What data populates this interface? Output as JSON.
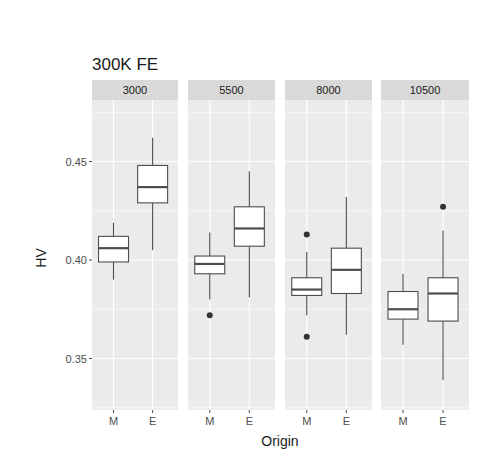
{
  "chart_data": {
    "type": "boxplot",
    "title": "300K FE",
    "xlabel": "Origin",
    "ylabel": "HV",
    "ylim": [
      0.325,
      0.475
    ],
    "yticks": [
      0.35,
      0.4,
      0.45
    ],
    "ytick_labels": [
      "0.35",
      "0.40",
      "0.45"
    ],
    "categories": [
      "M",
      "E"
    ],
    "grid": true,
    "facets": [
      {
        "label": "3000",
        "boxes": [
          {
            "category": "M",
            "whisker_low": 0.39,
            "q1": 0.399,
            "median": 0.406,
            "q3": 0.412,
            "whisker_high": 0.419,
            "outliers": []
          },
          {
            "category": "E",
            "whisker_low": 0.405,
            "q1": 0.429,
            "median": 0.437,
            "q3": 0.448,
            "whisker_high": 0.462,
            "outliers": []
          }
        ]
      },
      {
        "label": "5500",
        "boxes": [
          {
            "category": "M",
            "whisker_low": 0.38,
            "q1": 0.393,
            "median": 0.398,
            "q3": 0.402,
            "whisker_high": 0.414,
            "outliers": [
              0.372
            ]
          },
          {
            "category": "E",
            "whisker_low": 0.381,
            "q1": 0.407,
            "median": 0.416,
            "q3": 0.427,
            "whisker_high": 0.445,
            "outliers": []
          }
        ]
      },
      {
        "label": "8000",
        "boxes": [
          {
            "category": "M",
            "whisker_low": 0.372,
            "q1": 0.382,
            "median": 0.385,
            "q3": 0.391,
            "whisker_high": 0.404,
            "outliers": [
              0.413,
              0.361
            ]
          },
          {
            "category": "E",
            "whisker_low": 0.362,
            "q1": 0.383,
            "median": 0.395,
            "q3": 0.406,
            "whisker_high": 0.432,
            "outliers": []
          }
        ]
      },
      {
        "label": "10500",
        "boxes": [
          {
            "category": "M",
            "whisker_low": 0.357,
            "q1": 0.37,
            "median": 0.375,
            "q3": 0.384,
            "whisker_high": 0.393,
            "outliers": []
          },
          {
            "category": "E",
            "whisker_low": 0.339,
            "q1": 0.369,
            "median": 0.383,
            "q3": 0.391,
            "whisker_high": 0.415,
            "outliers": [
              0.427
            ]
          }
        ]
      }
    ]
  },
  "colors": {
    "panel_bg": "#ebebeb",
    "strip_bg": "#d9d9d9",
    "grid_major": "#ffffff",
    "box_fill": "#ffffff",
    "box_line": "#4d4d4d",
    "outlier": "#333333",
    "tick": "#4d4d4d"
  }
}
